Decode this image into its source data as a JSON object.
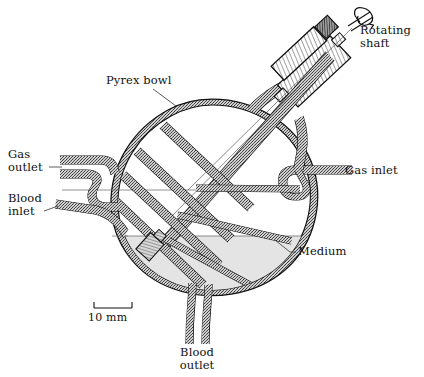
{
  "figure": {
    "type": "technical-cross-section-diagram",
    "background_color": "#ffffff",
    "ink_color": "#111111",
    "wall_fill_color": "#b9b9b9",
    "medium_fill_color": "#e4e4e4",
    "hatch_color": "#2a2a2a"
  },
  "labels": {
    "rotating_shaft": "Rotating\nshaft",
    "pyrex_bowl": "Pyrex bowl",
    "gas_outlet": "Gas\noutlet",
    "blood_inlet": "Blood\ninlet",
    "gas_inlet": "Gas inlet",
    "medium": "Medium",
    "blood_outlet": "Blood\noutlet"
  },
  "scale_bar": {
    "value": "10 mm",
    "length_px": 38,
    "tick_style": "end-serifs"
  },
  "components": [
    {
      "name": "pyrex-bowl",
      "label": "Pyrex bowl"
    },
    {
      "name": "rotating-shaft",
      "label": "Rotating shaft"
    },
    {
      "name": "shaft-housing",
      "label": ""
    },
    {
      "name": "gas-outlet-port",
      "label": "Gas outlet"
    },
    {
      "name": "blood-inlet-port",
      "label": "Blood inlet"
    },
    {
      "name": "gas-inlet-port",
      "label": "Gas inlet"
    },
    {
      "name": "blood-outlet-port",
      "label": "Blood outlet"
    },
    {
      "name": "medium-pool",
      "label": "Medium"
    },
    {
      "name": "rotating-discs",
      "label": ""
    }
  ]
}
